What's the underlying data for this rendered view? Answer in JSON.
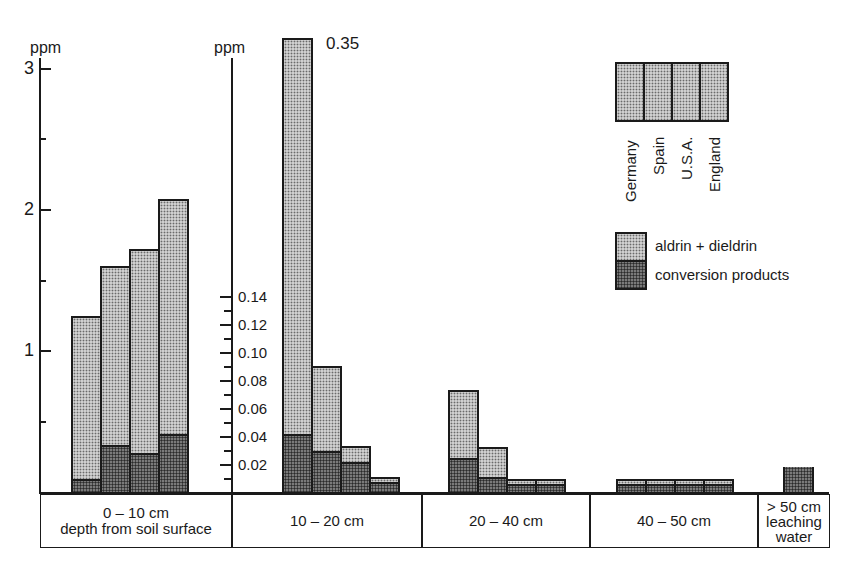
{
  "chart_data": {
    "type": "bar",
    "stacked": true,
    "title": "",
    "ylabel_left": "ppm",
    "ylabel_right": "ppm",
    "left_axis": {
      "ticks": [
        "1",
        "2",
        "3"
      ],
      "range": [
        0,
        3
      ]
    },
    "right_axis": {
      "ticks": [
        "0.02",
        "0.04",
        "0.06",
        "0.08",
        "0.10",
        "0.12",
        "0.14"
      ],
      "range": [
        0,
        0.15
      ],
      "broken_bar_label": "0.35"
    },
    "countries": [
      "Germany",
      "Spain",
      "U.S.A.",
      "England"
    ],
    "categories": [
      "0 – 10 cm depth from soil surface",
      "10 – 20 cm",
      "20 – 40 cm",
      "40 – 50 cm",
      "> 50 cm leaching water"
    ],
    "series": [
      {
        "name": "aldrin + dieldrin (total incl. conversion products)",
        "groups": [
          {
            "category": "0 – 10 cm",
            "axis": "left",
            "values": [
              1.25,
              1.6,
              1.72,
              2.08
            ]
          },
          {
            "category": "10 – 20 cm",
            "axis": "right",
            "values": [
              0.35,
              0.09,
              0.033,
              0.011
            ]
          },
          {
            "category": "20 – 40 cm",
            "axis": "right",
            "values": [
              0.073,
              0.032,
              0.009,
              0.009
            ]
          },
          {
            "category": "40 – 50 cm",
            "axis": "right",
            "values": [
              0.009,
              0.009,
              0.009,
              0.009
            ]
          },
          {
            "category": "> 50 cm leaching water",
            "axis": "right",
            "values": [
              0.018
            ]
          }
        ]
      },
      {
        "name": "conversion products",
        "groups": [
          {
            "category": "0 – 10 cm",
            "axis": "left",
            "values": [
              0.08,
              0.32,
              0.26,
              0.4
            ]
          },
          {
            "category": "10 – 20 cm",
            "axis": "right",
            "values": [
              0.04,
              0.028,
              0.02,
              0.006
            ]
          },
          {
            "category": "20 – 40 cm",
            "axis": "right",
            "values": [
              0.023,
              0.009,
              0.004,
              0.004
            ]
          },
          {
            "category": "40 – 50 cm",
            "axis": "right",
            "values": [
              0.004,
              0.004,
              0.004,
              0.004
            ]
          },
          {
            "category": "> 50 cm leaching water",
            "axis": "right",
            "values": [
              0.018
            ]
          }
        ]
      }
    ],
    "legend": {
      "countries": [
        "Germany",
        "Spain",
        "U.S.A.",
        "England"
      ],
      "items": [
        "aldrin + dieldrin",
        "conversion products"
      ],
      "position": "upper right"
    },
    "grid": false
  },
  "labels": {
    "ppm_left": "ppm",
    "ppm_right": "ppm",
    "left_ticks": [
      "3",
      "2",
      "1"
    ],
    "right_ticks": [
      "0.14",
      "0.12",
      "0.10",
      "0.08",
      "0.06",
      "0.04",
      "0.02"
    ],
    "broken": "0.35",
    "cat0_line1": "0 – 10 cm",
    "cat0_line2": "depth from soil surface",
    "cat1": "10 – 20 cm",
    "cat2": "20 – 40 cm",
    "cat3": "40 – 50 cm",
    "cat4_line1": "> 50 cm",
    "cat4_line2": "leaching",
    "cat4_line3": "water",
    "legend_countries": [
      "Germany",
      "Spain",
      "U.S.A.",
      "England"
    ],
    "legend_items": [
      "aldrin + dieldrin",
      "conversion products"
    ]
  }
}
